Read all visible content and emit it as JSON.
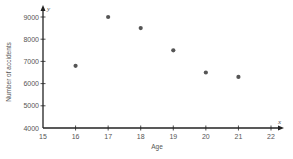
{
  "chart_data": {
    "type": "scatter",
    "title": "",
    "xlabel": "Age",
    "ylabel": "Number of accidents",
    "x_axis_letter": "x",
    "y_axis_letter": "y",
    "xlim": [
      15,
      22
    ],
    "ylim": [
      4000,
      9000
    ],
    "x_ticks": [
      15,
      16,
      17,
      18,
      19,
      20,
      21,
      22
    ],
    "y_ticks": [
      4000,
      5000,
      6000,
      7000,
      8000,
      9000
    ],
    "grid": false,
    "legend": null,
    "points": [
      {
        "x": 16,
        "y": 6800
      },
      {
        "x": 17,
        "y": 9000
      },
      {
        "x": 18,
        "y": 8500
      },
      {
        "x": 19,
        "y": 7500
      },
      {
        "x": 20,
        "y": 6500
      },
      {
        "x": 21,
        "y": 6300
      }
    ],
    "colors": {
      "axis": "#222222",
      "point": "#555555",
      "text": "#555555"
    }
  }
}
